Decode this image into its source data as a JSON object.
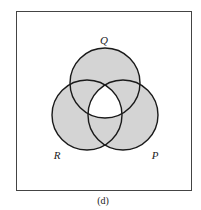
{
  "diagram": {
    "type": "venn",
    "caption": "(d)",
    "sets": [
      {
        "name": "Q",
        "label": "Q",
        "cx": 105,
        "cy": 83,
        "r": 35
      },
      {
        "name": "R",
        "label": "R",
        "cx": 87,
        "cy": 115,
        "r": 35
      },
      {
        "name": "P",
        "label": "P",
        "cx": 123,
        "cy": 115,
        "r": 35
      }
    ],
    "shaded_region": "union of Q, R, P excluding the triple intersection Q∩R∩P",
    "unshaded_region": "Q∩R∩P and the outside of all circles",
    "colors": {
      "shade": "#d4d4d4",
      "stroke": "#1a1a1a",
      "frame": "#444444",
      "background": "#ffffff"
    }
  }
}
